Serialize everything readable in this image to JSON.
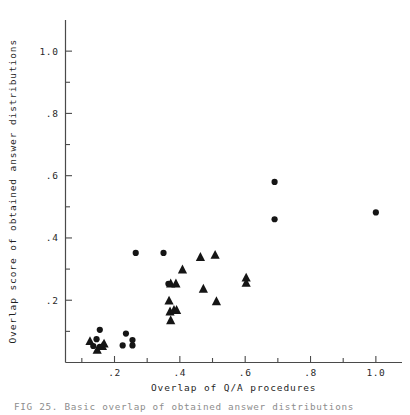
{
  "figure": {
    "caption": "FIG 25.  Basic overlap of obtained answer distributions"
  },
  "chart_data": {
    "type": "scatter",
    "title": "",
    "xlabel": "Overlap of Q/A procedures",
    "ylabel": "Overlap score of obtained answer distributions",
    "xlim": [
      0.05,
      1.08
    ],
    "ylim": [
      0.0,
      1.1
    ],
    "xticks": [
      0.2,
      0.4,
      0.6,
      0.8,
      1.0
    ],
    "xticklabels": [
      ".2",
      ".4",
      ".6",
      ".8",
      "1.0"
    ],
    "yticks": [
      0.2,
      0.4,
      0.6,
      0.8,
      1.0
    ],
    "yticklabels": [
      ".2",
      ".4",
      ".6",
      ".8",
      "1.0"
    ],
    "xminorticks": [
      0.1,
      0.3,
      0.5,
      0.7,
      0.9
    ],
    "yminorticks": [
      0.1,
      0.3,
      0.5,
      0.7,
      0.9
    ],
    "grid": false,
    "legend": "none",
    "marker_color": "#151515",
    "series": [
      {
        "name": "circle",
        "marker": "circle",
        "points": [
          [
            0.155,
            0.105
          ],
          [
            0.145,
            0.075
          ],
          [
            0.155,
            0.05
          ],
          [
            0.135,
            0.053
          ],
          [
            0.235,
            0.093
          ],
          [
            0.255,
            0.072
          ],
          [
            0.225,
            0.055
          ],
          [
            0.255,
            0.055
          ],
          [
            0.265,
            0.352
          ],
          [
            0.35,
            0.352
          ],
          [
            0.365,
            0.253
          ],
          [
            0.69,
            0.58
          ],
          [
            0.69,
            0.46
          ],
          [
            1.0,
            0.482
          ]
        ]
      },
      {
        "name": "triangle",
        "marker": "triangle",
        "points": [
          [
            0.125,
            0.068
          ],
          [
            0.147,
            0.04
          ],
          [
            0.163,
            0.052
          ],
          [
            0.168,
            0.06
          ],
          [
            0.372,
            0.253
          ],
          [
            0.388,
            0.253
          ],
          [
            0.367,
            0.198
          ],
          [
            0.37,
            0.163
          ],
          [
            0.382,
            0.168
          ],
          [
            0.39,
            0.168
          ],
          [
            0.372,
            0.135
          ],
          [
            0.408,
            0.298
          ],
          [
            0.463,
            0.338
          ],
          [
            0.508,
            0.345
          ],
          [
            0.472,
            0.236
          ],
          [
            0.512,
            0.196
          ],
          [
            0.603,
            0.272
          ],
          [
            0.603,
            0.255
          ]
        ]
      }
    ]
  }
}
